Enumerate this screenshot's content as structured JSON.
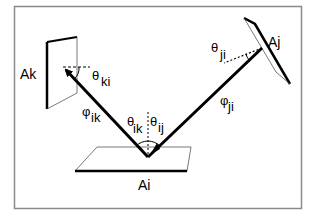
{
  "diagram": {
    "type": "radiosity-form-factor-geometry",
    "frame_color": "#8a8a8a",
    "line_color": "#000000",
    "surfaces": {
      "ak": "Ak",
      "aj": "Aj",
      "ai": "Ai"
    },
    "angles": {
      "theta_ki": {
        "base": "θ",
        "sub": "ki"
      },
      "theta_ji": {
        "base": "θ",
        "sub": "ji"
      },
      "theta_ik": {
        "base": "θ",
        "sub": "ik"
      },
      "theta_ij": {
        "base": "θ",
        "sub": "ij"
      },
      "phi_ik": {
        "base": "φ",
        "sub": "ik"
      },
      "phi_ji": {
        "base": "φ",
        "sub": "ji"
      }
    }
  }
}
